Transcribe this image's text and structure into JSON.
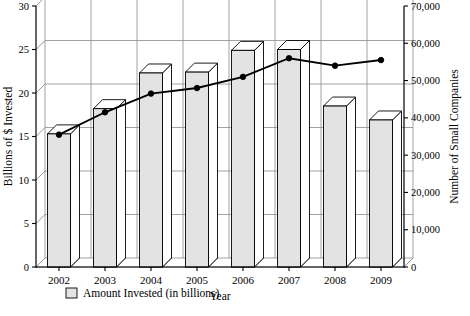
{
  "chart_data": {
    "type": "bar",
    "title": "",
    "subtitle": "",
    "xlabel": "Year",
    "ylabel": "Billions of $ Invested",
    "y2label": "Number of Small Companies",
    "categories": [
      "2002",
      "2003",
      "2004",
      "2005",
      "2006",
      "2007",
      "2008",
      "2009"
    ],
    "ylim": [
      0,
      30
    ],
    "y2lim": [
      0,
      70000
    ],
    "yticks": [
      "0",
      "5",
      "10",
      "15",
      "20",
      "25",
      "30"
    ],
    "ytick_values": [
      0,
      5,
      10,
      15,
      20,
      25,
      30
    ],
    "y2ticks": [
      "0",
      "10,000",
      "20,000",
      "30,000",
      "40,000",
      "50,000",
      "60,000",
      "70,000"
    ],
    "y2tick_values": [
      0,
      10000,
      20000,
      30000,
      40000,
      50000,
      60000,
      70000
    ],
    "grid": true,
    "legend_position": "bottom-left",
    "series": [
      {
        "name": "Amount Invested (in billions)",
        "kind": "bar",
        "axis": "left",
        "values": [
          15.3,
          18.2,
          22.3,
          22.4,
          24.9,
          25.0,
          18.5,
          16.9
        ]
      },
      {
        "name": "Number of Small Companies",
        "kind": "line",
        "axis": "right",
        "values": [
          35500,
          41500,
          46500,
          48000,
          51000,
          56000,
          54000,
          55500
        ]
      }
    ]
  },
  "legend": {
    "items": [
      {
        "label": "Amount Invested (in billions)",
        "swatch": "bar-swatch",
        "color": "#e3e3e3"
      }
    ]
  },
  "colors": {
    "bar_front": "#e3e3e3",
    "bar_top": "#ffffff",
    "bar_outline": "#000000",
    "line": "#000000",
    "grid": "#8c8c8c",
    "background": "#ffffff"
  }
}
